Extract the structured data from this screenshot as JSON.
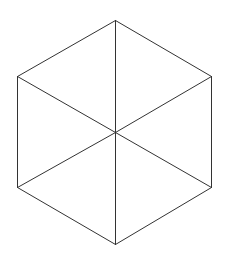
{
  "diagram": {
    "shape": "regular hexagon divided into six triangles",
    "stroke_color": "#333333",
    "stroke_width": 1,
    "background": "#ffffff",
    "center": [
      115,
      132
    ],
    "vertices": [
      [
        115,
        20
      ],
      [
        211,
        76
      ],
      [
        211,
        187
      ],
      [
        115,
        244
      ],
      [
        17,
        187
      ],
      [
        17,
        76
      ]
    ],
    "edges": [
      {
        "name": "edge-top-right",
        "from": 0,
        "to": 1
      },
      {
        "name": "edge-right",
        "from": 1,
        "to": 2
      },
      {
        "name": "edge-bottom-right",
        "from": 2,
        "to": 3
      },
      {
        "name": "edge-bottom-left",
        "from": 3,
        "to": 4
      },
      {
        "name": "edge-left",
        "from": 4,
        "to": 5
      },
      {
        "name": "edge-top-left",
        "from": 5,
        "to": 0
      }
    ],
    "spokes": [
      {
        "name": "spoke-top",
        "to": 0
      },
      {
        "name": "spoke-upper-right",
        "to": 1
      },
      {
        "name": "spoke-lower-right",
        "to": 2
      },
      {
        "name": "spoke-bottom",
        "to": 3
      },
      {
        "name": "spoke-lower-left",
        "to": 4
      },
      {
        "name": "spoke-upper-left",
        "to": 5
      }
    ]
  }
}
